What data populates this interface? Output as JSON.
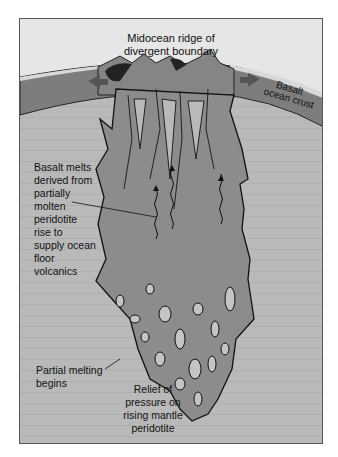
{
  "diagram": {
    "type": "cross-section",
    "labels": {
      "ridge": [
        "Midocean ridge of",
        "divergent boundary"
      ],
      "crust": [
        "Basalt",
        "ocean crust"
      ],
      "melts": [
        "Basalt melts",
        "derived from",
        "partially",
        "molten",
        "peridotite",
        "rise to",
        "supply ocean",
        "floor",
        "volcanics"
      ],
      "partial": [
        "Partial melting",
        "begins"
      ],
      "relief": [
        "Relief of",
        "pressure on",
        "rising mantle",
        "peridotite"
      ]
    },
    "colors": {
      "sky": "#e6e6e6",
      "mantle": "#b9b9b9",
      "plume": "#8c8c8c",
      "crust": "#7d7d7d",
      "outline": "#1a1a1a",
      "sediment": "#d8d8d8"
    }
  }
}
